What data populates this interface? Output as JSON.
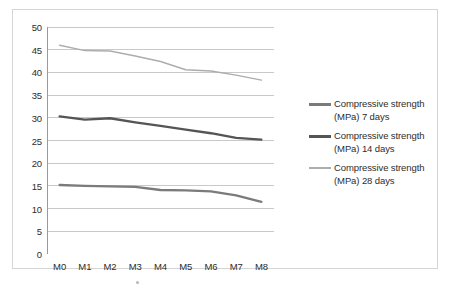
{
  "chart_data": {
    "type": "line",
    "title": "",
    "xlabel": "",
    "ylabel": "",
    "categories": [
      "M0",
      "M1",
      "M2",
      "M3",
      "M4",
      "M5",
      "M6",
      "M7",
      "M8"
    ],
    "ylim": [
      0,
      50
    ],
    "ytick_step": 5,
    "ytick_labels": [
      "0",
      "5",
      "10",
      "15",
      "20",
      "25",
      "30",
      "35",
      "40",
      "45",
      "50"
    ],
    "grid": "horizontal",
    "legend_position": "right",
    "series": [
      {
        "name": "Compressive strength (MPa) 7 days",
        "label_line1": "Compressive strength",
        "label_line2": "(MPa) 7 days",
        "color": "#7b7b7b",
        "values": [
          15.2,
          15.0,
          14.9,
          14.8,
          14.1,
          14.0,
          13.8,
          12.9,
          11.5
        ]
      },
      {
        "name": "Compressive strength (MPa) 14 days",
        "label_line1": "Compressive strength",
        "label_line2": "(MPa) 14 days",
        "color": "#555555",
        "values": [
          30.3,
          29.6,
          29.9,
          29.0,
          28.2,
          27.4,
          26.6,
          25.6,
          25.2
        ]
      },
      {
        "name": "Compressive strength (MPa) 28 days",
        "label_line1": "Compressive strength",
        "label_line2": "(MPa) 28 days",
        "color": "#adadad",
        "values": [
          46.0,
          44.8,
          44.7,
          43.6,
          42.4,
          40.6,
          40.3,
          39.4,
          38.3
        ]
      }
    ],
    "colors": {
      "gridline": "#c9c9c9",
      "axis": "#9a9a9a",
      "text": "#2d2d2d",
      "frame": "#d5d5d5",
      "background": "#ffffff"
    }
  }
}
